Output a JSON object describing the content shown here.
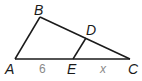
{
  "diagram": {
    "type": "triangle-with-parallel-segment",
    "vertices": {
      "A": {
        "label": "A",
        "x": 15,
        "y": 59
      },
      "B": {
        "label": "B",
        "x": 40,
        "y": 17
      },
      "C": {
        "label": "C",
        "x": 130,
        "y": 59
      },
      "D": {
        "label": "D",
        "x": 86,
        "y": 38
      },
      "E": {
        "label": "E",
        "x": 73,
        "y": 59
      }
    },
    "segments": [
      {
        "from": "A",
        "to": "B"
      },
      {
        "from": "B",
        "to": "C"
      },
      {
        "from": "A",
        "to": "C"
      },
      {
        "from": "D",
        "to": "E"
      }
    ],
    "lengths": {
      "AE": "6",
      "EC": "x"
    },
    "colors": {
      "line": "#1a1a1a",
      "length_label": "#8a8a8a"
    }
  }
}
